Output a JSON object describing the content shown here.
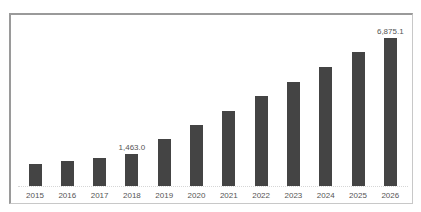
{
  "chart_data": {
    "type": "bar",
    "title": "",
    "xlabel": "",
    "ylabel": "",
    "categories": [
      "2015",
      "2016",
      "2017",
      "2018",
      "2019",
      "2020",
      "2021",
      "2022",
      "2023",
      "2024",
      "2025",
      "2026"
    ],
    "values": [
      1043,
      1182,
      1321,
      1463.0,
      2165,
      2842,
      3491,
      4172,
      4835,
      5517,
      6198,
      6875.1
    ],
    "data_labels": {
      "2018": "1,463.0",
      "2026": "6,875.1"
    },
    "ylim": [
      0,
      7000
    ],
    "grid": false,
    "legend": null,
    "bar_color": "#444444"
  },
  "header": {
    "title_cropped": ""
  },
  "labels": {
    "x": [
      "2015",
      "2016",
      "2017",
      "2018",
      "2019",
      "2020",
      "2021",
      "2022",
      "2023",
      "2024",
      "2025",
      "2026"
    ],
    "annot_2018": "1,463.0",
    "annot_2026": "6,875.1"
  }
}
